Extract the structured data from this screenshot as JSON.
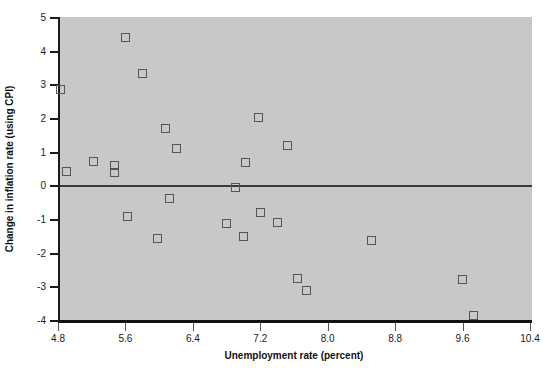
{
  "chart_data": {
    "type": "scatter",
    "title": "",
    "xlabel": "Unemployment rate (percent)",
    "ylabel": "Change in inflation rate (using CPI)",
    "xlim": [
      4.8,
      10.4
    ],
    "ylim": [
      -4,
      5
    ],
    "xticks": [
      "4.8",
      "5.6",
      "6.4",
      "7.2",
      "8.0",
      "8.8",
      "9.6",
      "10.4"
    ],
    "xtick_values": [
      4.8,
      5.6,
      6.4,
      7.2,
      8.0,
      8.8,
      9.6,
      10.4
    ],
    "yticks": [
      "5",
      "4",
      "3",
      "2",
      "1",
      "0",
      "-1",
      "-2",
      "-3",
      "-4"
    ],
    "ytick_values": [
      5,
      4,
      3,
      2,
      1,
      0,
      -1,
      -2,
      -3,
      -4
    ],
    "grid": false,
    "legend": null,
    "plot_background": "#c8c8c8",
    "marker": "open-square",
    "marker_color": "#555555",
    "reference_line": {
      "y": 0,
      "color": "#3a3a3a"
    },
    "points": [
      {
        "x": 4.8,
        "y": 2.85
      },
      {
        "x": 4.88,
        "y": 0.4
      },
      {
        "x": 5.2,
        "y": 0.7
      },
      {
        "x": 5.45,
        "y": 0.6
      },
      {
        "x": 5.45,
        "y": 0.38
      },
      {
        "x": 5.58,
        "y": 4.4
      },
      {
        "x": 5.6,
        "y": -0.92
      },
      {
        "x": 5.78,
        "y": 3.32
      },
      {
        "x": 5.96,
        "y": -1.58
      },
      {
        "x": 6.05,
        "y": 1.68
      },
      {
        "x": 6.1,
        "y": -0.38
      },
      {
        "x": 6.18,
        "y": 1.1
      },
      {
        "x": 6.78,
        "y": -1.12
      },
      {
        "x": 6.88,
        "y": -0.05
      },
      {
        "x": 6.98,
        "y": -1.52
      },
      {
        "x": 7.0,
        "y": 0.68
      },
      {
        "x": 7.15,
        "y": 2.02
      },
      {
        "x": 7.18,
        "y": -0.8
      },
      {
        "x": 7.38,
        "y": -1.1
      },
      {
        "x": 7.5,
        "y": 1.18
      },
      {
        "x": 7.62,
        "y": -2.78
      },
      {
        "x": 7.72,
        "y": -3.12
      },
      {
        "x": 8.5,
        "y": -1.65
      },
      {
        "x": 9.58,
        "y": -2.8
      },
      {
        "x": 9.7,
        "y": -3.88
      }
    ]
  }
}
